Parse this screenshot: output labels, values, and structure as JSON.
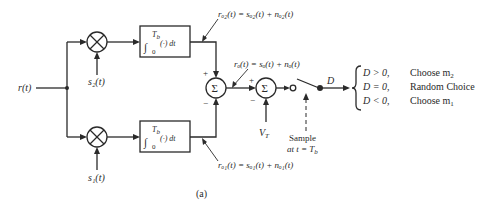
{
  "input": {
    "label": "r(t)"
  },
  "upper_branch": {
    "reference_signal": "s₂(t)",
    "integrator": {
      "upper_limit": "T",
      "upper_limit_sub": "b",
      "lower_limit": "0",
      "body": "(·) dt"
    },
    "output_label": "rₒ₂(t) = sₒ₂(t) + nₒ₂(t)"
  },
  "lower_branch": {
    "reference_signal": "s₁(t)",
    "integrator": {
      "upper_limit": "T",
      "upper_limit_sub": "b",
      "lower_limit": "0",
      "body": "(·) dt"
    },
    "output_label": "rₒ₁(t) = sₒ₁(t) + nₒ₁(t)"
  },
  "summer1": {
    "symbol": "Σ",
    "sign_top": "+",
    "sign_bottom": "−"
  },
  "summer1_output_label": "rₒ(t) = sₒ(t) + nₒ(t)",
  "summer2": {
    "symbol": "Σ",
    "sign_left": "+",
    "sign_bottom": "−",
    "threshold": "V",
    "threshold_sub": "T"
  },
  "sampler": {
    "label_line1": "Sample",
    "label_line2": "at t = T",
    "label_sub": "b"
  },
  "decision": {
    "variable": "D",
    "rules": [
      {
        "condition": "D > 0,",
        "action": "Choose m",
        "action_sub": "2"
      },
      {
        "condition": "D = 0,",
        "action": "Random Choice",
        "action_sub": ""
      },
      {
        "condition": "D < 0,",
        "action": "Choose m",
        "action_sub": "1"
      }
    ]
  },
  "caption": "(a)"
}
